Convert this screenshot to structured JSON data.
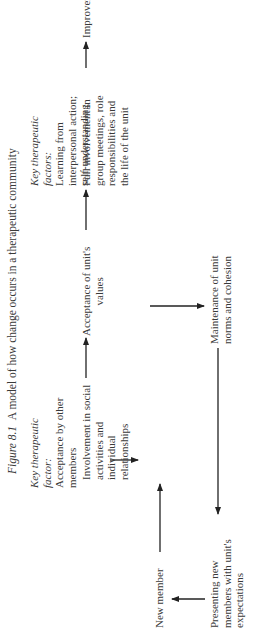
{
  "title": {
    "figure_label": "Figure 8.1",
    "caption": "A model of how change occurs in a therapeutic community"
  },
  "key_factors": [
    {
      "heading": "Key therapeutic factor:",
      "heading_line1": "Key therapeutic",
      "heading_line2": "factor:",
      "lines": [
        "Acceptance by other",
        "members"
      ]
    },
    {
      "heading": "Key therapeutic factors:",
      "heading_line1": "Key therapeutic",
      "heading_line2": "factors:",
      "lines": [
        "Learning from",
        "interpersonal action;",
        "self-understanding"
      ]
    }
  ],
  "nodes": {
    "new_member": {
      "lines": [
        "New member"
      ]
    },
    "involvement": {
      "lines": [
        "Involvement in social",
        "activities and",
        "individual",
        "relationships"
      ]
    },
    "acceptance_values": {
      "lines": [
        "Acceptance of unit's",
        "values"
      ]
    },
    "full_involvement": {
      "lines": [
        "Full involvement in",
        "group meetings, role",
        "responsibilities and",
        "the life of the unit"
      ]
    },
    "improvement": {
      "lines": [
        "Improvement"
      ]
    },
    "maintenance": {
      "lines": [
        "Maintenance of unit",
        "norms and cohesion"
      ]
    },
    "presenting": {
      "lines": [
        "Presenting new",
        "members with unit's",
        "expectations"
      ]
    }
  },
  "edges": [
    {
      "from": "new_member",
      "to": "involvement"
    },
    {
      "from": "involvement",
      "to": "acceptance_values"
    },
    {
      "from": "acceptance_values",
      "to": "full_involvement"
    },
    {
      "from": "full_involvement",
      "to": "improvement"
    },
    {
      "from": "acceptance_values",
      "to": "maintenance"
    },
    {
      "from": "maintenance",
      "to": "presenting"
    },
    {
      "from": "presenting",
      "to": "new_member"
    },
    {
      "from": "key_factor_1",
      "to": "involvement"
    }
  ],
  "orientation": "rotated 90 degrees counter-clockwise"
}
